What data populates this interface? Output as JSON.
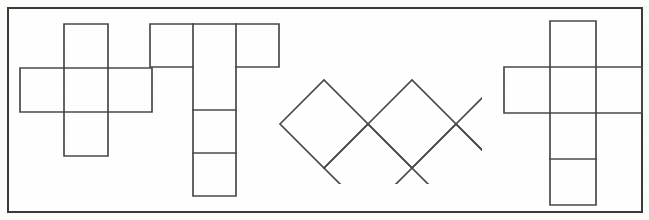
{
  "canvas": {
    "width": 649,
    "height": 220,
    "background_color": "#fdfdfc",
    "title": "Geometric net figures"
  },
  "frame": {
    "name": "outer-border-rectangle",
    "x": 8,
    "y": 8,
    "width": 634,
    "height": 204,
    "stroke_color": "#3a3a3a",
    "stroke_width": 2,
    "fill_color": "#ffffff"
  },
  "style": {
    "shape_stroke_color": "#4a4a4a",
    "shape_stroke_width": 1.7,
    "shape_fill": "none"
  },
  "figures": [
    {
      "id": "figure-1",
      "label": "Cross-shaped cube net",
      "description": "Plus/cross polyomino of five squares: one above, one below, one left, one right of a central square",
      "square_size": 44,
      "square_count": 5,
      "outline": "64,24 108,24 108,68 152,68 152,112 108,112 108,156 64,156 64,112 20,112 20,68 64,68",
      "interior_lines": [
        "64,68 108,68",
        "64,112 108,112",
        "64,68 64,112",
        "108,68 108,112"
      ]
    },
    {
      "id": "figure-2",
      "label": "T-shaped cube net",
      "description": "Three squares in a top row with a vertical column of three squares descending from the middle square",
      "square_size": 43,
      "square_count": 6,
      "outline": "150,24 279,24 279,67 236,67 236,196 193,196 193,67 150,67",
      "interior_lines": [
        "193,24 193,67",
        "236,24 236,67",
        "193,110 236,110",
        "193,153 236,153"
      ]
    },
    {
      "id": "figure-3",
      "label": "Diamond zigzag strip",
      "description": "Chain of five squares rotated forty-five degrees forming an alternating up-down zigzag band",
      "diamond_count": 5,
      "half_diagonal": 44,
      "diamonds": [
        "280,124 324,80 368,124 324,168",
        "324,168 368,124 412,168 368,212",
        "368,124 412,80 456,124 412,168",
        "412,168 456,124 500,168 456,212",
        "456,124 500,80 544,124 500,168"
      ],
      "clip": {
        "x": 268,
        "y": 76,
        "width": 214,
        "height": 108
      }
    },
    {
      "id": "figure-4",
      "label": "Z-shaped cube net",
      "description": "Vertical column of four squares with one square attached left of the second row and one attached right of the third row",
      "square_size": 46,
      "square_count": 6,
      "outline": "550,21 596,21 596,67 642,67 642,113 596,113 596,205 550,205 550,113 504,113 504,67 550,67",
      "interior_lines": [
        "550,67 596,67",
        "550,113 596,113",
        "550,159 596,159",
        "550,67 550,113",
        "596,67 596,113"
      ]
    }
  ]
}
